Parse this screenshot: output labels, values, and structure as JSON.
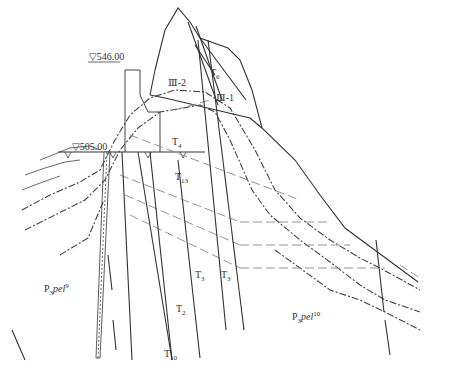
{
  "drawing": {
    "type": "geological cross-section of dam foundation",
    "elevations": {
      "crest": "▽546.00",
      "base": "▽505.00"
    },
    "rock_units": {
      "left": {
        "base": "P",
        "sub1": "3",
        "italic": "pel",
        "sup": "9"
      },
      "right": {
        "base": "P",
        "sub1": "3",
        "italic": "pel",
        "sup": "10"
      }
    },
    "zones": {
      "zone_iii_2": "Ⅲ-2",
      "zone_iii_1": "Ⅲ-1"
    },
    "faults": {
      "t6": {
        "base": "T",
        "sub": "6"
      },
      "t4": {
        "base": "T",
        "sub": "4"
      },
      "t13": {
        "base": "T",
        "sub": "13"
      },
      "t3a": {
        "base": "T",
        "sub": "3"
      },
      "t3b": {
        "base": "T",
        "sub": "3"
      },
      "t2": {
        "base": "T",
        "sub": "2"
      },
      "t10": {
        "base": "T",
        "sub": "10"
      }
    },
    "colors": {
      "line": "#333333",
      "dashed": "#888888",
      "background": "#ffffff"
    }
  }
}
